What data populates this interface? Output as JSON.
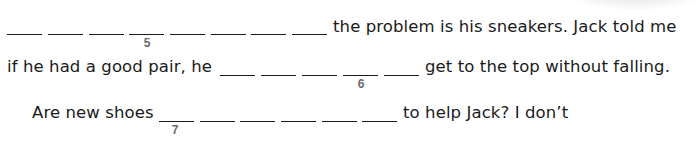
{
  "exercise": {
    "line1": {
      "blank_count": 8,
      "number": "5",
      "number_under_blank": 4,
      "text_after": "the problem is his sneakers. Jack told me"
    },
    "line2": {
      "text_before": "if he had a good pair, he",
      "blank_count": 5,
      "number": "6",
      "number_under_blank": 4,
      "text_after": "get to the top without falling."
    },
    "line3": {
      "text_before": "Are new shoes",
      "blank_count": 6,
      "number": "7",
      "number_under_blank": 1,
      "text_after": "to help Jack? I don’t"
    }
  },
  "colors": {
    "text": "#1a1a1a",
    "number": "#6b6b6b",
    "background": "#ffffff"
  }
}
